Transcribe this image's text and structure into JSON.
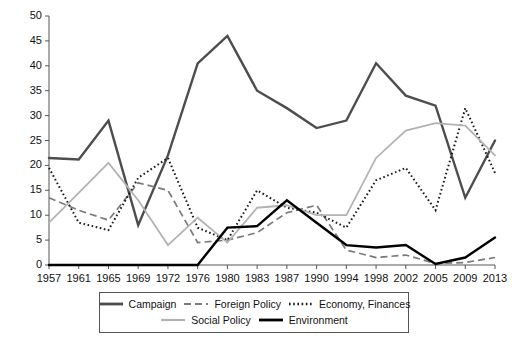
{
  "chart_data": {
    "type": "line",
    "title": "",
    "subtitle": "",
    "xlabel": "",
    "ylabel": "",
    "xlim_categories": 16,
    "ylim": [
      0,
      50
    ],
    "ytick_step": 5,
    "grid": false,
    "legend_position": "bottom",
    "categories": [
      "1957",
      "1961",
      "1965",
      "1969",
      "1972",
      "1976",
      "1980",
      "1983",
      "1987",
      "1990",
      "1994",
      "1998",
      "2002",
      "2005",
      "2009",
      "2013"
    ],
    "yticks": [
      "0",
      "5",
      "10",
      "15",
      "20",
      "25",
      "30",
      "35",
      "40",
      "45",
      "50"
    ],
    "series": [
      {
        "name": "Campaign",
        "style": "solid-thick-darkgray",
        "color": "#4d4d4d",
        "values": [
          21.5,
          21.2,
          29.0,
          8.0,
          22.0,
          40.5,
          46.0,
          35.0,
          31.5,
          27.5,
          29.0,
          40.5,
          34.0,
          32.0,
          13.5,
          25.0
        ]
      },
      {
        "name": "Foreign Policy",
        "style": "dashed-gray",
        "color": "#7a7a7a",
        "values": [
          13.5,
          11.0,
          9.0,
          16.5,
          15.0,
          4.5,
          5.0,
          6.5,
          10.5,
          12.0,
          3.0,
          1.5,
          2.0,
          0.3,
          0.5,
          1.5
        ]
      },
      {
        "name": "Economy, Finances",
        "style": "dotted-black",
        "color": "#1a1a1a",
        "values": [
          19.5,
          8.5,
          7.0,
          17.5,
          21.5,
          7.5,
          5.0,
          15.0,
          11.5,
          10.5,
          7.5,
          17.0,
          19.5,
          11.0,
          31.5,
          18.5
        ]
      },
      {
        "name": "Social Policy",
        "style": "solid-lightgray",
        "color": "#b3b3b3",
        "values": [
          8.5,
          14.5,
          20.5,
          13.0,
          4.0,
          9.5,
          4.5,
          11.5,
          12.0,
          10.0,
          10.0,
          21.5,
          27.0,
          28.5,
          28.0,
          22.0
        ]
      },
      {
        "name": "Environment",
        "style": "solid-thick-black",
        "color": "#000000",
        "values": [
          0.0,
          0.0,
          0.0,
          0.0,
          0.0,
          0.0,
          7.5,
          7.8,
          13.0,
          8.5,
          4.0,
          3.5,
          4.0,
          0.2,
          1.5,
          5.5
        ]
      }
    ]
  },
  "legend": {
    "rows": [
      [
        {
          "label": "Campaign",
          "swatch": "solid-thick-darkgray-swatch"
        },
        {
          "label": "Foreign Policy",
          "swatch": "dashed-gray-swatch"
        },
        {
          "label": "Economy, Finances",
          "swatch": "dotted-black-swatch"
        }
      ],
      [
        {
          "label": "Social Policy",
          "swatch": "solid-lightgray-swatch"
        },
        {
          "label": "Environment",
          "swatch": "solid-thick-black-swatch"
        }
      ]
    ]
  }
}
